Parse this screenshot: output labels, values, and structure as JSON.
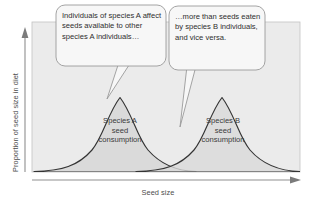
{
  "figure": {
    "type": "conceptual-diagram"
  },
  "axes": {
    "y_label": "Proportion of seed size in diet",
    "x_label": "Seed size",
    "y_axis_arrow": "up-arrow",
    "x_axis_arrow": "right-arrow"
  },
  "curves": [
    {
      "id": "species-a",
      "label_line1": "Species A",
      "label_line2": "seed",
      "label_line3": "consumption",
      "peak_x": 120,
      "peak_y": 97
    },
    {
      "id": "species-b",
      "label_line1": "Species B",
      "label_line2": "seed",
      "label_line3": "consumption",
      "peak_x": 222,
      "peak_y": 97
    }
  ],
  "callouts": [
    {
      "id": "callout-left",
      "text": "Individuals of species A affect seeds available to other species A individuals…"
    },
    {
      "id": "callout-right",
      "text": "…more than seeds eaten by species B individuals, and vice versa."
    }
  ],
  "colors": {
    "panel_fill": "#ebebeb",
    "curve_fill": "#d8d8d8",
    "curve_stroke": "#333333",
    "bubble_fill": "#f7f7f7",
    "bubble_stroke": "#9a9a9a",
    "axis_arrow": "#8f8f8f",
    "text": "#3b3b3b"
  }
}
